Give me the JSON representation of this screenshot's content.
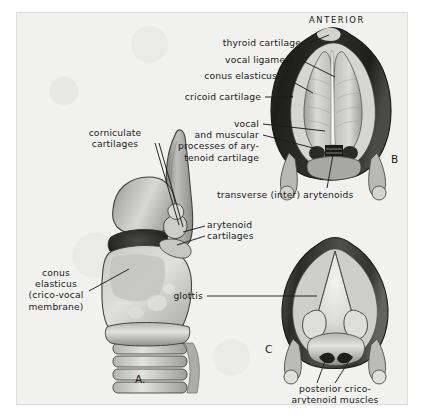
{
  "plate": {
    "orientation_heading": "ANTERIOR",
    "background_color": "#f1f1ef",
    "ink_color": "#1b1b1b"
  },
  "figures": [
    {
      "id": "A",
      "letter": "A.",
      "view": "lateral external view of larynx"
    },
    {
      "id": "B",
      "letter": "B",
      "view": "superior view of larynx, adducted vocal folds"
    },
    {
      "id": "C",
      "letter": "C",
      "view": "superior view of larynx, abducted open glottis"
    }
  ],
  "labels": {
    "figure_a": [
      {
        "name": "corniculate-cartilages",
        "text": "corniculate\ncartilages"
      },
      {
        "name": "arytenoid-cartilages",
        "text": "arytenoid\ncartilages"
      },
      {
        "name": "conus-elasticus",
        "text": "conus\nelasticus\n(crico-vocal\nmembrane)"
      }
    ],
    "figure_b": [
      {
        "name": "thyroid-cartilage",
        "text": "thyroid cartilage"
      },
      {
        "name": "vocal-ligament",
        "text": "vocal ligament"
      },
      {
        "name": "conus-elasticus",
        "text": "conus elasticus"
      },
      {
        "name": "cricoid-cartilage",
        "text": "cricoid cartilage"
      },
      {
        "name": "vocal-and-muscular-processes",
        "text": "vocal\nand muscular\nprocesses of ary-\ntenoid cartilage"
      },
      {
        "name": "transverse-inter-arytenoids",
        "text": "transverse (inter) arytenoids"
      }
    ],
    "figure_c": [
      {
        "name": "glottis",
        "text": "glottis"
      },
      {
        "name": "posterior-cricoarytenoid-muscles",
        "text": "posterior crico-\narytenoid muscles"
      }
    ]
  }
}
